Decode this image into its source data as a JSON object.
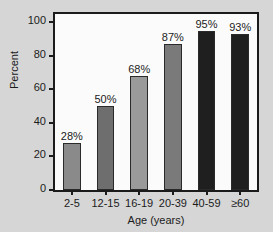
{
  "figure": {
    "background_color": "#d6d6d6",
    "plot_background_color": "#fbfbfb",
    "frame_color": "#1b1b1b"
  },
  "chart_data": {
    "type": "bar",
    "title": "",
    "subtitle": "",
    "xlabel": "Age (years)",
    "ylabel": "Percent",
    "categories": [
      "2-5",
      "12-15",
      "16-19",
      "20-39",
      "40-59",
      "≥60"
    ],
    "values": [
      28,
      50,
      68,
      87,
      95,
      93
    ],
    "data_labels": [
      "28%",
      "50%",
      "68%",
      "87%",
      "95%",
      "93%"
    ],
    "bar_colors": [
      "#8a8a8a",
      "#6e6e6e",
      "#9a9a9a",
      "#7a7a7a",
      "#1f1f1f",
      "#1f1f1f"
    ],
    "bar_edge_color": "#2a2a2a",
    "ylim": [
      0,
      105
    ],
    "yticks": [
      0,
      20,
      40,
      60,
      80,
      100
    ],
    "ytick_labels": [
      "0",
      "20",
      "40",
      "60",
      "80",
      "100"
    ],
    "grid": false,
    "legend": null,
    "legend_position": "none"
  }
}
